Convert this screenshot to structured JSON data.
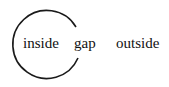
{
  "labels": {
    "inside": "inside",
    "gap": "gap",
    "outside": "outside"
  },
  "colors": {
    "stroke": "#1a1a1a",
    "text": "#111111"
  }
}
